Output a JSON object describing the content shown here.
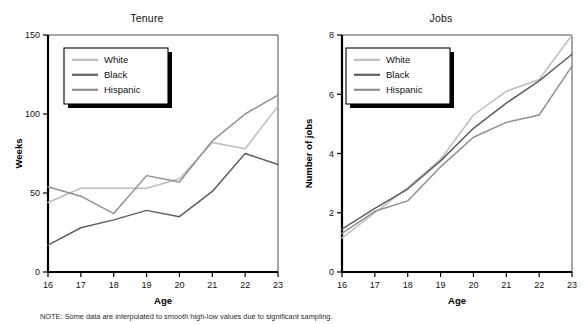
{
  "figure": {
    "note": "NOTE: Some data are interpolated to smooth high-low values due to significant sampling."
  },
  "series_colors": {
    "white": "#bdbdbd",
    "black": "#5f5f5f",
    "hispanic": "#909090"
  },
  "legend": {
    "items": [
      {
        "label": "White",
        "key": "white"
      },
      {
        "label": "Black",
        "key": "black"
      },
      {
        "label": "Hispanic",
        "key": "hispanic"
      }
    ]
  },
  "chart_data": [
    {
      "type": "line",
      "title": "Tenure",
      "xlabel": "Age",
      "ylabel": "Weeks",
      "x": [
        16,
        17,
        18,
        19,
        20,
        21,
        22,
        23
      ],
      "xticks": [
        "16",
        "17",
        "18",
        "19",
        "20",
        "21",
        "22",
        "23"
      ],
      "yticks": [
        "0",
        "50",
        "100",
        "150"
      ],
      "xlim": [
        16,
        23
      ],
      "ylim": [
        0,
        150
      ],
      "grid": false,
      "legend_position": "top-left",
      "series": [
        {
          "name": "White",
          "values": [
            44,
            53,
            53,
            53,
            59,
            82,
            78,
            105
          ]
        },
        {
          "name": "Black",
          "values": [
            17,
            28,
            33,
            39,
            35,
            51,
            75,
            68
          ]
        },
        {
          "name": "Hispanic",
          "values": [
            54,
            48,
            37,
            61,
            57,
            83,
            100,
            112
          ]
        }
      ]
    },
    {
      "type": "line",
      "title": "Jobs",
      "xlabel": "Age",
      "ylabel": "Number of jobs",
      "x": [
        16,
        17,
        18,
        19,
        20,
        21,
        22,
        23
      ],
      "xticks": [
        "16",
        "17",
        "18",
        "19",
        "20",
        "21",
        "22",
        "23"
      ],
      "yticks": [
        "0",
        "2",
        "4",
        "6",
        "8"
      ],
      "xlim": [
        16,
        23
      ],
      "ylim": [
        0,
        8
      ],
      "grid": false,
      "legend_position": "top-left",
      "series": [
        {
          "name": "White",
          "values": [
            1.15,
            2.0,
            2.85,
            3.8,
            5.3,
            6.1,
            6.5,
            8.0
          ]
        },
        {
          "name": "Black",
          "values": [
            1.45,
            2.15,
            2.8,
            3.75,
            4.85,
            5.7,
            6.45,
            7.35
          ]
        },
        {
          "name": "Hispanic",
          "values": [
            1.3,
            2.05,
            2.4,
            3.55,
            4.55,
            5.05,
            5.3,
            6.95
          ]
        }
      ]
    }
  ]
}
